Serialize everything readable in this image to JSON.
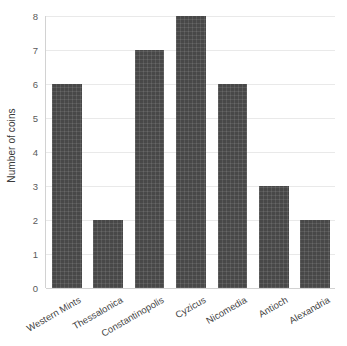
{
  "chart_data": {
    "type": "bar",
    "title": "",
    "xlabel": "",
    "ylabel": "Number of coins",
    "categories": [
      "Western Mints",
      "Thessalonica",
      "Constantinopolis",
      "Cyzicus",
      "Nicomedia",
      "Antioch",
      "Alexandria"
    ],
    "values": [
      6,
      2,
      7,
      8,
      6,
      3,
      2
    ],
    "ylim": [
      0,
      8
    ],
    "ytick_labels": [
      "0",
      "1",
      "2",
      "3",
      "4",
      "5",
      "6",
      "7",
      "8"
    ],
    "ytick_values": [
      0,
      1,
      2,
      3,
      4,
      5,
      6,
      7,
      8
    ],
    "grid": "horizontal",
    "legend": "none",
    "bar_color": "#484848",
    "gridline_color": "#e9e9e9",
    "axis_color": "#d2d2d2",
    "background_color": "#ffffff",
    "xtick_rotation": -30
  }
}
